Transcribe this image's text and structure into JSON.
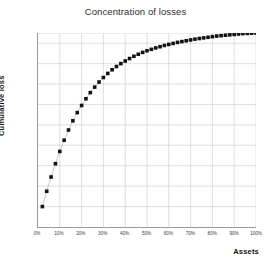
{
  "chart_data": {
    "type": "scatter",
    "title": "Concentration of losses",
    "xlabel": "Assets",
    "ylabel": "Cumulative loss",
    "xlim": [
      0,
      100
    ],
    "ylim": [
      5,
      100
    ],
    "grid": true,
    "legend": null,
    "marker": "square",
    "marker_color": "#111111",
    "line_color": "#b0b0b0",
    "xtick_labels": [
      "0%",
      "10%",
      "20%",
      "30%",
      "40%",
      "50%",
      "60%",
      "70%",
      "80%",
      "90%",
      "100%"
    ],
    "xticks": [
      0,
      10,
      20,
      30,
      40,
      50,
      60,
      70,
      80,
      90,
      100
    ],
    "ytick_labels": [
      "5%",
      "15%",
      "25%",
      "35%",
      "45%",
      "55%",
      "65%",
      "75%",
      "85%",
      "95%",
      "100%"
    ],
    "yticks": [
      5,
      15,
      25,
      35,
      45,
      55,
      65,
      75,
      85,
      95,
      100
    ],
    "x": [
      2,
      4,
      6,
      8,
      10,
      12,
      14,
      16,
      18,
      20,
      22,
      24,
      26,
      28,
      30,
      32,
      34,
      36,
      38,
      40,
      42,
      44,
      46,
      48,
      50,
      52,
      54,
      56,
      58,
      60,
      62,
      64,
      66,
      68,
      70,
      72,
      74,
      76,
      78,
      80,
      82,
      84,
      86,
      88,
      90,
      92,
      94,
      96,
      98,
      100
    ],
    "values": [
      15.0,
      22.5,
      29.5,
      36.0,
      42.0,
      47.5,
      52.5,
      57.0,
      61.0,
      64.5,
      67.8,
      70.8,
      73.5,
      76.0,
      78.2,
      80.2,
      82.0,
      83.6,
      85.0,
      86.3,
      87.5,
      88.6,
      89.6,
      90.5,
      91.3,
      92.0,
      92.7,
      93.3,
      93.9,
      94.4,
      94.9,
      95.4,
      95.8,
      96.2,
      96.6,
      97.0,
      97.3,
      97.6,
      97.9,
      98.2,
      98.5,
      98.7,
      98.9,
      99.1,
      99.3,
      99.5,
      99.7,
      99.8,
      99.9,
      100.0
    ]
  },
  "colors": {
    "marker": "#111111",
    "line": "#b0b0b0",
    "grid": "#c9c9c9",
    "axis": "#9a9a9a",
    "text": "#2b2b2b"
  }
}
